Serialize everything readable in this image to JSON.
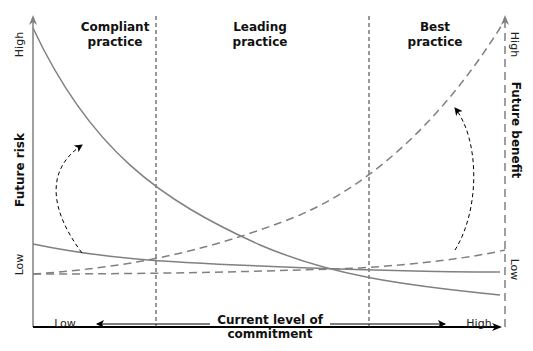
{
  "diagram": {
    "zones": [
      {
        "label_line1": "Compliant",
        "label_line2": "practice"
      },
      {
        "label_line1": "Leading",
        "label_line2": "practice"
      },
      {
        "label_line1": "Best",
        "label_line2": "practice"
      }
    ],
    "left_axis": {
      "title": "Future risk",
      "high": "High",
      "low": "Low"
    },
    "right_axis": {
      "title": "Future benefit",
      "high": "High",
      "low": "Low"
    },
    "x_axis": {
      "title_line1": "Current level of",
      "title_line2": "commitment",
      "low": "Low",
      "high": "High"
    },
    "colors": {
      "curve": "#808080",
      "axis": "#000000",
      "divider": "#333333",
      "text": "#111111"
    },
    "curves": [
      {
        "name": "high-risk-curve",
        "style": "solid",
        "description": "Future risk decreasing steeply from high"
      },
      {
        "name": "low-risk-curve",
        "style": "solid",
        "description": "Future risk decreasing gently from low"
      },
      {
        "name": "high-benefit-curve",
        "style": "dashed",
        "description": "Future benefit increasing steeply to high"
      },
      {
        "name": "low-benefit-curve",
        "style": "dashed",
        "description": "Future benefit increasing gently"
      }
    ],
    "shift_arrows": [
      {
        "name": "risk-shift-arrow",
        "description": "Dashed curved arrow from low risk curve up to high risk curve"
      },
      {
        "name": "benefit-shift-arrow",
        "description": "Dashed curved arrow from low benefit curve up to high benefit curve"
      }
    ]
  }
}
